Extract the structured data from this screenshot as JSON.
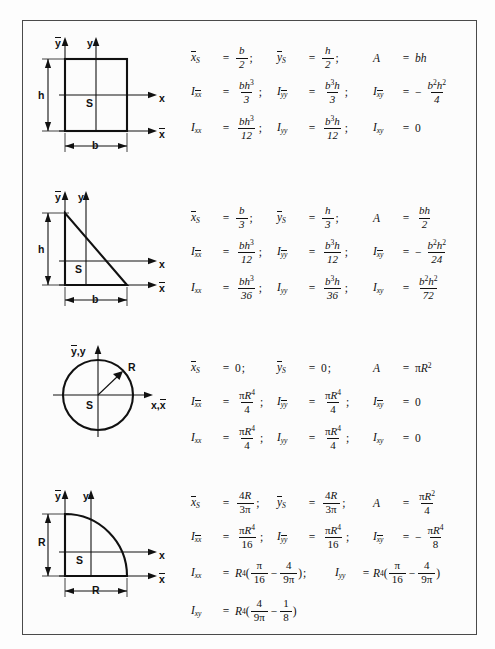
{
  "document": {
    "title": "Moments of inertia and centroids of plane areas",
    "rows": [
      {
        "shape": "rectangle",
        "figure": {
          "axis_labels": {
            "y_bar": "y",
            "y": "y",
            "x": "x",
            "x_bar": "x",
            "centroid": "S"
          },
          "dimensions": {
            "height": "h",
            "width": "b"
          }
        },
        "equations": [
          [
            {
              "lhs": "x",
              "lhs_sub": "S",
              "lhs_bar": true,
              "rhs_num": "b",
              "rhs_den": "2"
            },
            {
              "lhs": "y",
              "lhs_sub": "S",
              "lhs_bar": true,
              "rhs_num": "h",
              "rhs_den": "2"
            },
            {
              "lhs": "A",
              "lhs_sub": "",
              "rhs_plain": "bh"
            }
          ],
          [
            {
              "lhs": "I",
              "lhs_sub": "xx",
              "sub_bar": true,
              "rhs_num": "bh3",
              "rhs_den": "3"
            },
            {
              "lhs": "I",
              "lhs_sub": "yy",
              "sub_bar": true,
              "rhs_num": "b3h",
              "rhs_den": "3"
            },
            {
              "lhs": "I",
              "lhs_sub": "xy",
              "sub_bar": true,
              "rhs_sign": "-",
              "rhs_num": "b2h2",
              "rhs_den": "4"
            }
          ],
          [
            {
              "lhs": "I",
              "lhs_sub": "xx",
              "rhs_num": "bh3",
              "rhs_den": "12"
            },
            {
              "lhs": "I",
              "lhs_sub": "yy",
              "rhs_num": "b3h",
              "rhs_den": "12"
            },
            {
              "lhs": "I",
              "lhs_sub": "xy",
              "rhs_plain": "0"
            }
          ]
        ]
      },
      {
        "shape": "triangle",
        "figure": {
          "axis_labels": {
            "y_bar": "y",
            "y": "y",
            "x": "x",
            "x_bar": "x",
            "centroid": "S"
          },
          "dimensions": {
            "height": "h",
            "width": "b"
          }
        },
        "equations": [
          [
            {
              "lhs": "x",
              "lhs_sub": "S",
              "lhs_bar": true,
              "rhs_num": "b",
              "rhs_den": "3"
            },
            {
              "lhs": "y",
              "lhs_sub": "S",
              "lhs_bar": true,
              "rhs_num": "h",
              "rhs_den": "3"
            },
            {
              "lhs": "A",
              "lhs_sub": "",
              "rhs_num": "bh",
              "rhs_den": "2"
            }
          ],
          [
            {
              "lhs": "I",
              "lhs_sub": "xx",
              "sub_bar": true,
              "rhs_num": "bh3",
              "rhs_den": "12"
            },
            {
              "lhs": "I",
              "lhs_sub": "yy",
              "sub_bar": true,
              "rhs_num": "b3h",
              "rhs_den": "12"
            },
            {
              "lhs": "I",
              "lhs_sub": "xy",
              "sub_bar": true,
              "rhs_sign": "-",
              "rhs_num": "b2h2",
              "rhs_den": "24"
            }
          ],
          [
            {
              "lhs": "I",
              "lhs_sub": "xx",
              "rhs_num": "bh3",
              "rhs_den": "36"
            },
            {
              "lhs": "I",
              "lhs_sub": "yy",
              "rhs_num": "b3h",
              "rhs_den": "36"
            },
            {
              "lhs": "I",
              "lhs_sub": "xy",
              "rhs_num": "b2h2",
              "rhs_den": "72"
            }
          ]
        ]
      },
      {
        "shape": "circle",
        "figure": {
          "axis_labels": {
            "vertical": "y,y",
            "horizontal": "x,x",
            "centroid": "S",
            "radius": "R"
          }
        },
        "equations": [
          [
            {
              "lhs": "x",
              "lhs_sub": "S",
              "lhs_bar": true,
              "rhs_plain": "0"
            },
            {
              "lhs": "y",
              "lhs_sub": "S",
              "lhs_bar": true,
              "rhs_plain": "0"
            },
            {
              "lhs": "A",
              "lhs_sub": "",
              "rhs_plain": "piR2"
            }
          ],
          [
            {
              "lhs": "I",
              "lhs_sub": "xx",
              "sub_bar": true,
              "rhs_num": "piR4",
              "rhs_den": "4"
            },
            {
              "lhs": "I",
              "lhs_sub": "yy",
              "sub_bar": true,
              "rhs_num": "piR4",
              "rhs_den": "4"
            },
            {
              "lhs": "I",
              "lhs_sub": "xy",
              "sub_bar": true,
              "rhs_plain": "0"
            }
          ],
          [
            {
              "lhs": "I",
              "lhs_sub": "xx",
              "rhs_num": "piR4",
              "rhs_den": "4"
            },
            {
              "lhs": "I",
              "lhs_sub": "yy",
              "rhs_num": "piR4",
              "rhs_den": "4"
            },
            {
              "lhs": "I",
              "lhs_sub": "xy",
              "rhs_plain": "0"
            }
          ]
        ]
      },
      {
        "shape": "quarter-circle",
        "figure": {
          "axis_labels": {
            "y_bar": "y",
            "y": "y",
            "x": "x",
            "x_bar": "x",
            "centroid": "S"
          },
          "dimensions": {
            "height": "R",
            "width": "R"
          }
        },
        "equations": [
          [
            {
              "lhs": "x",
              "lhs_sub": "S",
              "lhs_bar": true,
              "rhs_num": "4R",
              "rhs_den": "3pi"
            },
            {
              "lhs": "y",
              "lhs_sub": "S",
              "lhs_bar": true,
              "rhs_num": "4R",
              "rhs_den": "3pi"
            },
            {
              "lhs": "A",
              "lhs_sub": "",
              "rhs_num": "piR2",
              "rhs_den": "4"
            }
          ],
          [
            {
              "lhs": "I",
              "lhs_sub": "xx",
              "sub_bar": true,
              "rhs_num": "piR4",
              "rhs_den": "16"
            },
            {
              "lhs": "I",
              "lhs_sub": "yy",
              "sub_bar": true,
              "rhs_num": "piR4",
              "rhs_den": "16"
            },
            {
              "lhs": "I",
              "lhs_sub": "xy",
              "sub_bar": true,
              "rhs_sign": "-",
              "rhs_num": "piR4",
              "rhs_den": "8"
            }
          ]
        ]
      }
    ],
    "quarter_special": {
      "ixx_label": "I",
      "ixx_sub": "xx",
      "iyy_label": "I",
      "iyy_sub": "yy",
      "ixy_label": "I",
      "ixy_sub": "xy",
      "prefix": "R",
      "exp": "4",
      "pi_over": "16",
      "frac2_num": "4",
      "frac2_den": "9",
      "ixy_num1": "4",
      "ixy_den1": "9",
      "ixy_num2": "1",
      "ixy_den2": "8"
    },
    "symbols": {
      "pi": "π",
      "minus": "−",
      "semicolon": ";",
      "equals": "="
    },
    "colors": {
      "ink": "#111111",
      "frame": "#4a4a4a",
      "paper": "#fcfcfc"
    }
  }
}
